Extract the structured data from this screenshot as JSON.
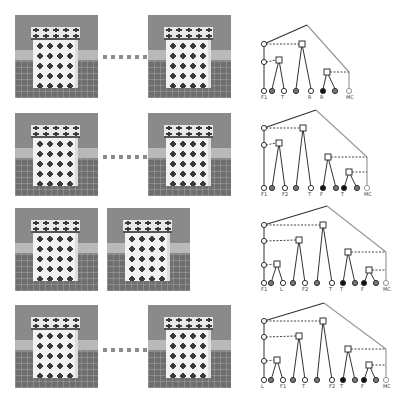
{
  "rows": [
    {
      "photos": [
        {
          "x": 15,
          "y": 15
        },
        {
          "x": 148,
          "y": 15
        }
      ],
      "separator": {
        "x": 103,
        "y": 55
      },
      "tree": {
        "apex": [
          307,
          25
        ],
        "root": [
          264,
          44
        ],
        "spine_nodes": [
          [
            264,
            44
          ],
          [
            264,
            62
          ]
        ],
        "squares": [
          [
            302,
            44
          ],
          [
            279,
            60
          ],
          [
            327,
            72
          ]
        ],
        "dashes": [
          [
            [
              266,
              44
            ],
            [
              299,
              44
            ]
          ],
          [
            [
              266,
              62
            ],
            [
              276,
              60
            ]
          ],
          [
            [
              330,
              72
            ],
            [
              349,
              72
            ]
          ]
        ],
        "lines": [
          [
            [
              264,
              44
            ],
            [
              264,
              89
            ]
          ],
          [
            [
              279,
              60
            ],
            [
              272,
              89
            ]
          ],
          [
            [
              279,
              60
            ],
            [
              284,
              89
            ]
          ],
          [
            [
              302,
              44
            ],
            [
              296,
              89
            ]
          ],
          [
            [
              302,
              44
            ],
            [
              311,
              89
            ]
          ],
          [
            [
              327,
              72
            ],
            [
              323,
              89
            ]
          ],
          [
            [
              327,
              72
            ],
            [
              335,
              89
            ]
          ]
        ],
        "gray_lines": [
          [
            [
              307,
              25
            ],
            [
              349,
              72
            ]
          ],
          [
            [
              349,
              72
            ],
            [
              349,
              89
            ]
          ]
        ],
        "black_line": [
          [
            264,
            44
          ],
          [
            307,
            25
          ]
        ],
        "leaves": [
          {
            "x": 264,
            "t": "o",
            "l": "F1"
          },
          {
            "x": 272,
            "t": "g"
          },
          {
            "x": 284,
            "t": "o",
            "l": "T"
          },
          {
            "x": 296,
            "t": "g"
          },
          {
            "x": 311,
            "t": "o",
            "l": "R"
          },
          {
            "x": 323,
            "t": "b",
            "l": "R"
          },
          {
            "x": 335,
            "t": "g"
          },
          {
            "x": 349,
            "t": "gray",
            "l": "MC"
          }
        ],
        "leaf_y": 91
      }
    },
    {
      "photos": [
        {
          "x": 15,
          "y": 113
        },
        {
          "x": 148,
          "y": 113
        }
      ],
      "separator": {
        "x": 103,
        "y": 155
      },
      "tree": {
        "apex": [
          316,
          110
        ],
        "root": [
          264,
          128
        ],
        "spine_nodes": [
          [
            264,
            128
          ],
          [
            264,
            145
          ]
        ],
        "squares": [
          [
            303,
            128
          ],
          [
            279,
            143
          ],
          [
            328,
            157
          ],
          [
            349,
            172
          ]
        ],
        "dashes": [
          [
            [
              266,
              128
            ],
            [
              300,
              128
            ]
          ],
          [
            [
              266,
              145
            ],
            [
              276,
              143
            ]
          ],
          [
            [
              331,
              157
            ],
            [
              367,
              157
            ]
          ],
          [
            [
              352,
              172
            ],
            [
              367,
              172
            ]
          ]
        ],
        "lines": [
          [
            [
              264,
              128
            ],
            [
              264,
              188
            ]
          ],
          [
            [
              279,
              143
            ],
            [
              272,
              188
            ]
          ],
          [
            [
              279,
              143
            ],
            [
              285,
              188
            ]
          ],
          [
            [
              303,
              128
            ],
            [
              296,
              188
            ]
          ],
          [
            [
              303,
              128
            ],
            [
              311,
              188
            ]
          ],
          [
            [
              328,
              157
            ],
            [
              323,
              188
            ]
          ],
          [
            [
              328,
              157
            ],
            [
              336,
              188
            ]
          ],
          [
            [
              349,
              172
            ],
            [
              344,
              188
            ]
          ],
          [
            [
              349,
              172
            ],
            [
              357,
              188
            ]
          ]
        ],
        "gray_lines": [
          [
            [
              316,
              110
            ],
            [
              367,
              157
            ]
          ],
          [
            [
              367,
              157
            ],
            [
              367,
              188
            ]
          ]
        ],
        "black_line": [
          [
            264,
            128
          ],
          [
            316,
            110
          ]
        ],
        "leaves": [
          {
            "x": 264,
            "t": "o",
            "l": "F1"
          },
          {
            "x": 272,
            "t": "g"
          },
          {
            "x": 285,
            "t": "o",
            "l": "F2"
          },
          {
            "x": 296,
            "t": "g"
          },
          {
            "x": 311,
            "t": "o",
            "l": "T"
          },
          {
            "x": 323,
            "t": "b",
            "l": "F"
          },
          {
            "x": 336,
            "t": "g"
          },
          {
            "x": 344,
            "t": "b",
            "l": "T"
          },
          {
            "x": 357,
            "t": "g"
          },
          {
            "x": 367,
            "t": "gray",
            "l": "MC"
          }
        ],
        "leaf_y": 188
      }
    },
    {
      "photos": [
        {
          "x": 15,
          "y": 208
        },
        {
          "x": 107,
          "y": 208
        }
      ],
      "tree": {
        "apex": [
          327,
          206
        ],
        "root": [
          264,
          225
        ],
        "spine_nodes": [
          [
            264,
            225
          ],
          [
            264,
            241
          ],
          [
            264,
            265
          ]
        ],
        "squares": [
          [
            323,
            225
          ],
          [
            299,
            240
          ],
          [
            277,
            264
          ],
          [
            348,
            252
          ],
          [
            369,
            270
          ]
        ],
        "dashes": [
          [
            [
              266,
              225
            ],
            [
              320,
              225
            ]
          ],
          [
            [
              266,
              241
            ],
            [
              296,
              240
            ]
          ],
          [
            [
              266,
              265
            ],
            [
              274,
              264
            ]
          ],
          [
            [
              351,
              252
            ],
            [
              386,
              252
            ]
          ],
          [
            [
              372,
              270
            ],
            [
              386,
              270
            ]
          ]
        ],
        "lines": [
          [
            [
              264,
              225
            ],
            [
              264,
              283
            ]
          ],
          [
            [
              277,
              264
            ],
            [
              271,
              283
            ]
          ],
          [
            [
              277,
              264
            ],
            [
              283,
              283
            ]
          ],
          [
            [
              299,
              240
            ],
            [
              293,
              283
            ]
          ],
          [
            [
              299,
              240
            ],
            [
              305,
              283
            ]
          ],
          [
            [
              323,
              225
            ],
            [
              317,
              283
            ]
          ],
          [
            [
              323,
              225
            ],
            [
              332,
              283
            ]
          ],
          [
            [
              348,
              252
            ],
            [
              343,
              283
            ]
          ],
          [
            [
              348,
              252
            ],
            [
              355,
              283
            ]
          ],
          [
            [
              369,
              270
            ],
            [
              364,
              283
            ]
          ],
          [
            [
              369,
              270
            ],
            [
              376,
              283
            ]
          ]
        ],
        "gray_lines": [
          [
            [
              327,
              206
            ],
            [
              386,
              252
            ]
          ],
          [
            [
              386,
              252
            ],
            [
              386,
              283
            ]
          ]
        ],
        "black_line": [
          [
            264,
            225
          ],
          [
            327,
            206
          ]
        ],
        "leaves": [
          {
            "x": 264,
            "t": "o",
            "l": "F1"
          },
          {
            "x": 271,
            "t": "g"
          },
          {
            "x": 283,
            "t": "o",
            "l": "L"
          },
          {
            "x": 293,
            "t": "g"
          },
          {
            "x": 305,
            "t": "o",
            "l": "F2"
          },
          {
            "x": 317,
            "t": "g"
          },
          {
            "x": 332,
            "t": "o",
            "l": "T"
          },
          {
            "x": 343,
            "t": "b",
            "l": "T"
          },
          {
            "x": 355,
            "t": "g"
          },
          {
            "x": 364,
            "t": "b",
            "l": "F"
          },
          {
            "x": 376,
            "t": "g"
          },
          {
            "x": 386,
            "t": "gray",
            "l": "MC"
          }
        ],
        "leaf_y": 283
      }
    },
    {
      "photos": [
        {
          "x": 15,
          "y": 305
        },
        {
          "x": 148,
          "y": 305
        }
      ],
      "separator": {
        "x": 103,
        "y": 348
      },
      "tree": {
        "apex": [
          324,
          303
        ],
        "root": [
          264,
          321
        ],
        "spine_nodes": [
          [
            264,
            321
          ],
          [
            264,
            337
          ],
          [
            264,
            361
          ]
        ],
        "squares": [
          [
            323,
            321
          ],
          [
            299,
            336
          ],
          [
            277,
            360
          ],
          [
            348,
            349
          ],
          [
            369,
            365
          ]
        ],
        "dashes": [
          [
            [
              266,
              321
            ],
            [
              320,
              321
            ]
          ],
          [
            [
              266,
              337
            ],
            [
              296,
              336
            ]
          ],
          [
            [
              266,
              361
            ],
            [
              274,
              360
            ]
          ],
          [
            [
              351,
              349
            ],
            [
              386,
              349
            ]
          ],
          [
            [
              372,
              365
            ],
            [
              386,
              365
            ]
          ]
        ],
        "lines": [
          [
            [
              264,
              321
            ],
            [
              264,
              380
            ]
          ],
          [
            [
              277,
              360
            ],
            [
              271,
              380
            ]
          ],
          [
            [
              277,
              360
            ],
            [
              283,
              380
            ]
          ],
          [
            [
              299,
              336
            ],
            [
              293,
              380
            ]
          ],
          [
            [
              299,
              336
            ],
            [
              305,
              380
            ]
          ],
          [
            [
              323,
              321
            ],
            [
              317,
              380
            ]
          ],
          [
            [
              323,
              321
            ],
            [
              332,
              380
            ]
          ],
          [
            [
              348,
              349
            ],
            [
              343,
              380
            ]
          ],
          [
            [
              348,
              349
            ],
            [
              355,
              380
            ]
          ],
          [
            [
              369,
              365
            ],
            [
              364,
              380
            ]
          ],
          [
            [
              369,
              365
            ],
            [
              376,
              380
            ]
          ]
        ],
        "gray_lines": [
          [
            [
              324,
              303
            ],
            [
              386,
              349
            ]
          ],
          [
            [
              386,
              349
            ],
            [
              386,
              380
            ]
          ]
        ],
        "black_line": [
          [
            264,
            321
          ],
          [
            324,
            303
          ]
        ],
        "leaves": [
          {
            "x": 264,
            "t": "o",
            "l": "L"
          },
          {
            "x": 271,
            "t": "g"
          },
          {
            "x": 283,
            "t": "o",
            "l": "F1"
          },
          {
            "x": 293,
            "t": "g"
          },
          {
            "x": 305,
            "t": "o",
            "l": "T"
          },
          {
            "x": 317,
            "t": "g"
          },
          {
            "x": 332,
            "t": "o",
            "l": "F2"
          },
          {
            "x": 343,
            "t": "b",
            "l": "T"
          },
          {
            "x": 355,
            "t": "g"
          },
          {
            "x": 364,
            "t": "b",
            "l": "F"
          },
          {
            "x": 376,
            "t": "g"
          },
          {
            "x": 386,
            "t": "gray",
            "l": "MC"
          }
        ],
        "leaf_y": 380
      }
    }
  ],
  "colors": {
    "line": "#333333",
    "gray": "#9a9a9a",
    "hatched": "#777777",
    "dash": "#444444"
  }
}
